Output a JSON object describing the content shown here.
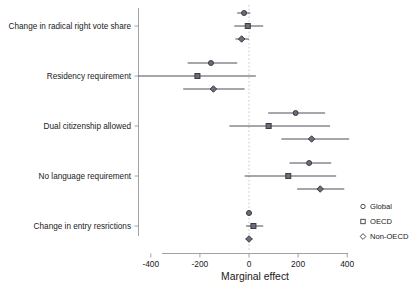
{
  "chart_data": {
    "type": "scatter",
    "subtype": "forest-plot",
    "title": "",
    "xlabel": "Marginal effect",
    "ylabel": "",
    "xlim": [
      -480,
      420
    ],
    "xticks": [
      -400,
      -200,
      0,
      200,
      400
    ],
    "xtick_labels": [
      "-400",
      "-200",
      "0",
      "200",
      "400"
    ],
    "grid": false,
    "zero_reference_line": 0,
    "legend_position": "right",
    "legend": [
      {
        "name": "Global",
        "marker": "circle"
      },
      {
        "name": "OECD",
        "marker": "square"
      },
      {
        "name": "Non-OECD",
        "marker": "diamond"
      }
    ],
    "categories": [
      "Change in radical right vote share",
      "Residency requirement",
      "Dual citizenship allowed",
      "No language requirement",
      "Change in entry resrictions"
    ],
    "series": [
      {
        "name": "Global",
        "marker": "circle",
        "estimates": [
          -20,
          -155,
          190,
          245,
          0
        ],
        "ci_low": [
          -48,
          -250,
          78,
          165,
          -12
        ],
        "ci_high": [
          5,
          -48,
          310,
          335,
          12
        ]
      },
      {
        "name": "OECD",
        "marker": "square",
        "estimates": [
          -5,
          -210,
          80,
          160,
          18
        ],
        "ci_low": [
          -60,
          -450,
          -80,
          -18,
          -12
        ],
        "ci_high": [
          58,
          28,
          330,
          355,
          58
        ]
      },
      {
        "name": "Non-OECD",
        "marker": "diamond",
        "estimates": [
          -30,
          -145,
          255,
          290,
          0
        ],
        "ci_low": [
          -55,
          -268,
          132,
          196,
          -14
        ],
        "ci_high": [
          0,
          -18,
          408,
          388,
          14
        ]
      }
    ]
  },
  "axis": {
    "x_title": "Marginal effect"
  },
  "colors": {
    "marker_fill": "#6d6d78",
    "marker_stroke": "#3b3b44",
    "axis": "#8a8a8a",
    "zero_line": "#b9b9b9",
    "text": "#1a1a1a"
  }
}
